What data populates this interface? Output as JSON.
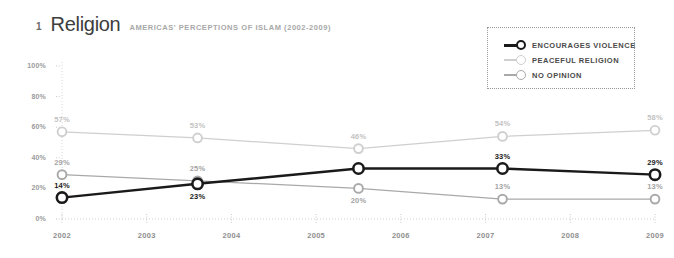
{
  "header": {
    "number": "1",
    "title": "Religion",
    "subtitle": "AMERICAS' PERCEPTIONS OF ISLAM (2002-2009)"
  },
  "legend": {
    "items": [
      {
        "label": "ENCOURAGES VIOLENCE",
        "color": "#1a1a1a"
      },
      {
        "label": "PEACEFUL RELIGION",
        "color": "#cfcfcf"
      },
      {
        "label": "NO OPINION",
        "color": "#a9a9a9"
      }
    ]
  },
  "chart_data": {
    "type": "line",
    "title": "Religion",
    "subtitle": "AMERICAS' PERCEPTIONS OF ISLAM (2002-2009)",
    "xlabel": "",
    "ylabel": "",
    "xlim": [
      2002,
      2009
    ],
    "ylim": [
      0,
      100
    ],
    "grid": false,
    "legend_position": "top-right",
    "x": [
      2002,
      2003.6,
      2005.5,
      2007.2,
      2009
    ],
    "xtick_labels": [
      "2002",
      "2003",
      "2004",
      "2005",
      "2006",
      "2007",
      "2008",
      "2009"
    ],
    "xticks": [
      2002,
      2003,
      2004,
      2005,
      2006,
      2007,
      2008,
      2009
    ],
    "ytick_labels": [
      "0%",
      "20%",
      "40%",
      "60%",
      "80%",
      "100%"
    ],
    "yticks": [
      0,
      20,
      40,
      60,
      80,
      100
    ],
    "series": [
      {
        "name": "ENCOURAGES VIOLENCE",
        "color": "#1a1a1a",
        "values": [
          14,
          23,
          33,
          33,
          29
        ],
        "point_labels": [
          "14%",
          "23%",
          "",
          "33%",
          "29%"
        ],
        "label_positions": [
          "above",
          "below",
          "",
          "above",
          "above"
        ]
      },
      {
        "name": "PEACEFUL RELIGION",
        "color": "#cfcfcf",
        "values": [
          57,
          53,
          46,
          54,
          58
        ],
        "point_labels": [
          "57%",
          "53%",
          "46%",
          "54%",
          "58%"
        ],
        "label_positions": [
          "above",
          "above",
          "above",
          "above",
          "above"
        ]
      },
      {
        "name": "NO OPINION",
        "color": "#a9a9a9",
        "values": [
          29,
          25,
          20,
          13,
          13
        ],
        "point_labels": [
          "29%",
          "25%",
          "20%",
          "13%",
          "13%"
        ],
        "label_positions": [
          "above",
          "above",
          "below",
          "above",
          "above"
        ]
      }
    ]
  }
}
